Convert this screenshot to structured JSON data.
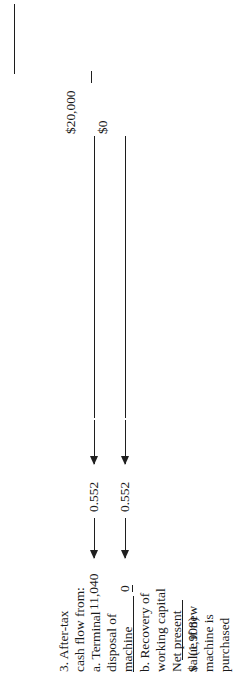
{
  "document": {
    "kind": "accounting-worksheet-fragment",
    "orientation_note": "rotated",
    "ink_color": "#1a1a1a",
    "paper_color": "#ffffff"
  },
  "header": {
    "amount_terminal_disposal": "$20,000",
    "amount_recovery_working_capital": "$0",
    "top_rule": true
  },
  "rows": [
    {
      "id": "after-tax-cash-flow-heading",
      "label_lines": [
        "3. After-tax",
        "cash flow from:"
      ],
      "amount": "",
      "factor": "",
      "present_value": ""
    },
    {
      "id": "terminal-disposal-of-machine",
      "label_lines": [
        "a. Terminal",
        "disposal of",
        "machine"
      ],
      "amount": "$20,000",
      "factor": "0.552",
      "present_value": "11,040"
    },
    {
      "id": "recovery-of-working-capital",
      "label_lines": [
        "b. Recovery of",
        "working capital"
      ],
      "amount": "$0",
      "factor": "0.552",
      "present_value": "0",
      "present_value_underlined": true
    },
    {
      "id": "net-present-value",
      "label_lines": [
        "Net present",
        "value if new",
        "machine is",
        "purchased"
      ],
      "amount": "",
      "factor": "",
      "present_value": "",
      "total_currency_symbol": "$",
      "total_value": "(1,908)"
    }
  ],
  "label_column": {
    "lines": [
      "3. After-tax",
      "cash flow from:",
      "a. Terminal",
      "disposal of",
      "machine",
      "b. Recovery of",
      "working capital",
      "Net present",
      "value if new",
      "machine is",
      "purchased"
    ]
  },
  "discount_factors": {
    "terminal_disposal": "0.552",
    "working_capital": "0.552"
  },
  "present_values": {
    "terminal_disposal": "11,040",
    "working_capital": "0"
  },
  "total": {
    "currency": "$",
    "value": "(1,908)"
  }
}
